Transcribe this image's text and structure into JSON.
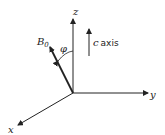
{
  "diagram": {
    "axes": {
      "z": {
        "label": "z"
      },
      "y": {
        "label": "y"
      },
      "x": {
        "label": "x"
      }
    },
    "field_vector": {
      "label": "B",
      "subscript": "0"
    },
    "angle": {
      "label": "φ"
    },
    "c_axis": {
      "letter": "c",
      "word": "axis"
    },
    "colors": {
      "stroke": "#222222",
      "background": "#ffffff"
    }
  }
}
